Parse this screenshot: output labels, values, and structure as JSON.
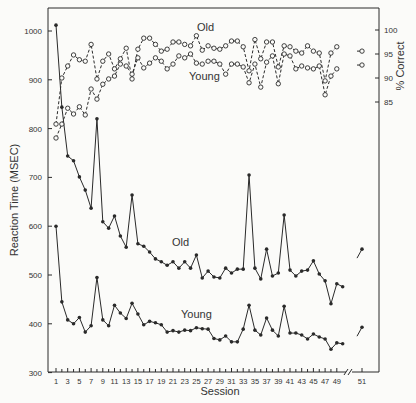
{
  "chart_data": {
    "type": "line",
    "title": "",
    "xlabel": "Session",
    "ylabel": "Reaction Time (MSEC)",
    "y2label": "% Correct",
    "ylim": [
      300,
      1040
    ],
    "y2lim": [
      85,
      100
    ],
    "yticks": [
      300,
      400,
      500,
      600,
      700,
      800,
      900,
      1000
    ],
    "y2ticks": [
      85,
      90,
      95,
      100
    ],
    "xticks": [
      1,
      3,
      5,
      7,
      9,
      11,
      13,
      15,
      17,
      19,
      21,
      23,
      25,
      27,
      29,
      31,
      33,
      35,
      37,
      39,
      41,
      43,
      45,
      47,
      49,
      51
    ],
    "grid": false,
    "annotations": [
      {
        "text": "Old",
        "near": "upper accuracy curve"
      },
      {
        "text": "Young",
        "near": "lower accuracy curve"
      },
      {
        "text": "Old",
        "near": "upper reaction time curve"
      },
      {
        "text": "Young",
        "near": "lower reaction time curve"
      }
    ],
    "x": [
      1,
      2,
      3,
      4,
      5,
      6,
      7,
      8,
      9,
      10,
      11,
      12,
      13,
      14,
      15,
      16,
      17,
      18,
      19,
      20,
      21,
      22,
      23,
      24,
      25,
      26,
      27,
      28,
      29,
      30,
      31,
      32,
      33,
      34,
      35,
      36,
      37,
      38,
      39,
      40,
      41,
      42,
      43,
      44,
      45,
      46,
      47,
      48,
      49,
      50
    ],
    "x_extra": 51,
    "series": [
      {
        "name": "RT Old",
        "axis": "left",
        "style": "solid-filled",
        "values": [
          1012,
          844,
          744,
          734,
          701,
          674,
          637,
          820,
          609,
          596,
          621,
          580,
          557,
          664,
          564,
          559,
          547,
          533,
          527,
          520,
          527,
          514,
          527,
          514,
          541,
          494,
          508,
          496,
          494,
          514,
          504,
          512,
          512,
          705,
          514,
          492,
          553,
          498,
          504,
          623,
          510,
          498,
          508,
          510,
          529,
          502,
          488,
          441,
          482,
          476
        ],
        "extra": 553
      },
      {
        "name": "RT Young",
        "axis": "left",
        "style": "solid-filled",
        "values": [
          600,
          445,
          408,
          400,
          413,
          383,
          396,
          495,
          408,
          396,
          438,
          422,
          411,
          442,
          420,
          398,
          405,
          402,
          398,
          383,
          386,
          383,
          387,
          386,
          392,
          390,
          389,
          370,
          367,
          375,
          363,
          363,
          389,
          438,
          387,
          377,
          412,
          387,
          375,
          436,
          381,
          381,
          377,
          369,
          379,
          373,
          369,
          348,
          361,
          359
        ],
        "extra": 393
      },
      {
        "name": "% Correct Old",
        "axis": "right",
        "style": "dashed-open",
        "values": [
          80.4,
          90.0,
          92.5,
          94.8,
          93.8,
          93.5,
          97.0,
          89.8,
          93.5,
          95.0,
          91.9,
          94.0,
          96.2,
          89.8,
          96.0,
          98.3,
          98.3,
          97.0,
          95.6,
          96.0,
          97.5,
          97.5,
          97.0,
          96.7,
          98.8,
          95.8,
          96.7,
          96.2,
          96.0,
          96.7,
          97.7,
          97.7,
          96.5,
          91.5,
          98.0,
          94.0,
          97.5,
          97.5,
          92.3,
          96.7,
          96.5,
          95.6,
          95.2,
          96.7,
          95.6,
          95.2,
          89.4,
          95.2,
          96.5,
          null
        ],
        "extra": 95.6
      },
      {
        "name": "% Correct Young",
        "axis": "right",
        "style": "dashed-open",
        "values": [
          77.5,
          80.4,
          83.7,
          82.5,
          84.0,
          82.3,
          87.7,
          85.6,
          88.7,
          89.8,
          90.4,
          92.9,
          92.5,
          90.8,
          94.2,
          92.1,
          93.1,
          94.2,
          93.5,
          91.9,
          92.9,
          94.6,
          94.2,
          95.0,
          93.1,
          92.9,
          93.5,
          93.5,
          92.9,
          90.8,
          92.9,
          92.9,
          92.3,
          89.0,
          92.9,
          88.1,
          93.3,
          94.6,
          88.8,
          95.0,
          94.6,
          91.9,
          92.5,
          92.1,
          91.9,
          92.5,
          86.5,
          90.4,
          91.9,
          null
        ],
        "extra": 92.7
      }
    ]
  },
  "labels": {
    "ylabel": "Reaction Time (MSEC)",
    "y2label": "% Correct",
    "xlabel": "Session",
    "old_acc": "Old",
    "young_acc": "Young",
    "old_rt": "Old",
    "young_rt": "Young"
  }
}
